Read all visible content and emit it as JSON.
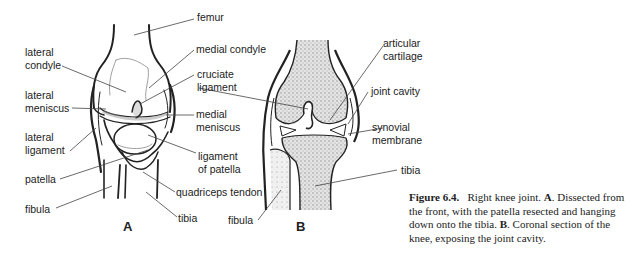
{
  "figure": {
    "number": "Figure 6.4.",
    "caption_parts": {
      "title": "Right knee joint.",
      "a_letter": "A",
      "a_text": ". Dissected from the front, with the patella resected and hanging down onto the tibia.",
      "b_letter": "B",
      "b_text": ". Coronal section of the knee, exposing the joint cavity."
    }
  },
  "panel_a": {
    "letter": "A",
    "labels": {
      "femur": "femur",
      "lateral_condyle": "lateral\ncondyle",
      "medial_condyle": "medial condyle",
      "cruciate_ligament": "cruciate\nligament",
      "lateral_meniscus": "lateral\nmeniscus",
      "medial_meniscus": "medial\nmeniscus",
      "lateral_ligament": "lateral\nligament",
      "ligament_of_patella": "ligament\nof patella",
      "patella": "patella",
      "quadriceps_tendon": "quadriceps tendon",
      "fibula": "fibula",
      "tibia": "tibia"
    }
  },
  "panel_b": {
    "letter": "B",
    "labels": {
      "articular_cartilage": "articular\ncartilage",
      "joint_cavity": "joint cavity",
      "synovial_membrane": "synovial\nmembrane",
      "tibia": "tibia",
      "fibula": "fibula"
    }
  },
  "colors": {
    "ink": "#222222",
    "bone_stipple": "#b8b8b8",
    "background": "#ffffff"
  }
}
